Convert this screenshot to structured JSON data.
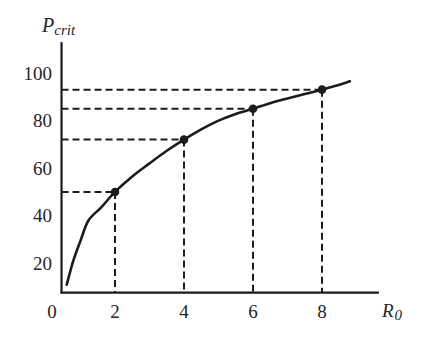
{
  "chart_data": {
    "type": "line",
    "title": "",
    "xlabel": {
      "main": "R",
      "sub": "0",
      "full": "R0"
    },
    "ylabel": {
      "main": "P",
      "sub": "crit",
      "full": "Pcrit"
    },
    "origin_label": "0",
    "x_ticks": [
      2,
      4,
      6,
      8
    ],
    "y_ticks": [
      20,
      40,
      60,
      80,
      100
    ],
    "xlim": [
      0.45,
      9.65
    ],
    "ylim": [
      7.7,
      113
    ],
    "grid": false,
    "legend": null,
    "series": [
      {
        "name": "Pcrit vs R0",
        "x": [
          0.6,
          0.79,
          1.0,
          1.23,
          1.6,
          2.0,
          2.5,
          3.0,
          3.5,
          4.0,
          4.5,
          5.0,
          5.5,
          6.0,
          6.5,
          7.0,
          7.5,
          8.0,
          8.4,
          8.81
        ],
        "y": [
          11,
          21,
          29.5,
          38,
          43.5,
          50,
          56.5,
          62,
          67.3,
          72,
          76.3,
          80,
          82.8,
          85,
          87.3,
          89.3,
          91.2,
          93,
          94.6,
          96.5
        ]
      }
    ],
    "marked_points": [
      {
        "x": 2,
        "y": 50
      },
      {
        "x": 4,
        "y": 72
      },
      {
        "x": 6,
        "y": 85
      },
      {
        "x": 8,
        "y": 93
      }
    ],
    "annotations": "Dashed guide lines drop from each marked point to both axes",
    "colors": {
      "ink": "#1c1c1c",
      "text": "#262626",
      "background": "#ffffff"
    }
  }
}
